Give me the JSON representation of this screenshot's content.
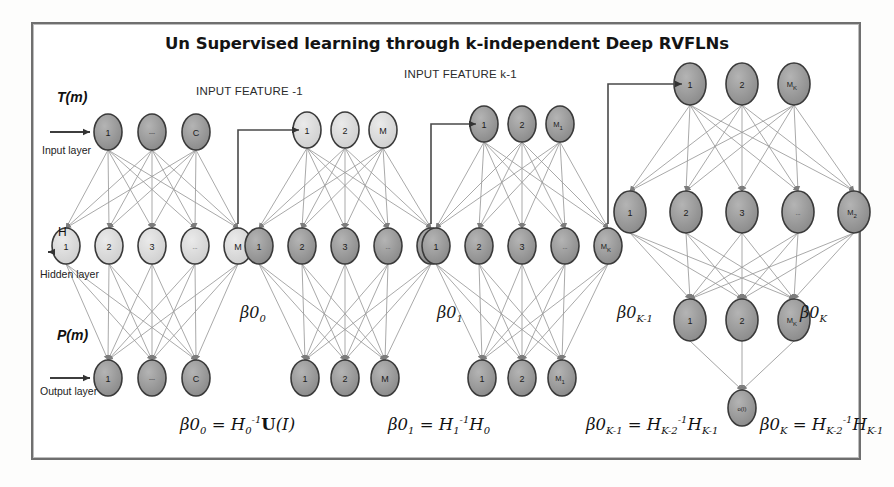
{
  "title": "Un Supervised learning through k-independent Deep RVFLNs",
  "annotations": {
    "input_feature_1": "INPUT FEATURE -1",
    "input_feature_k1": "INPUT FEATURE k-1",
    "signal_top": "T(m)",
    "signal_mid": "H",
    "signal_bottom": "P(m)",
    "layer_input": "Input layer",
    "layer_hidden": "Hidden layer",
    "layer_output": "Output layer"
  },
  "beta_labels": [
    {
      "base": "β0",
      "sub": "0"
    },
    {
      "base": "β0",
      "sub": "1"
    },
    {
      "base": "β0",
      "sub": "K-1"
    },
    {
      "base": "β0",
      "sub": "K"
    }
  ],
  "formulas": [
    {
      "lhs": "β0",
      "lhs_sub": "0",
      "rhs_html": "H<sub>0</sub><sup>-1</sup><b>U</b>(<i>I</i>)"
    },
    {
      "lhs": "β0",
      "lhs_sub": "1",
      "rhs_html": "H<sub>1</sub><sup>-1</sup>H<sub>0</sub>"
    },
    {
      "lhs": "β0",
      "lhs_sub": "K-1",
      "rhs_html": "H<sub>K-2</sub><sup>-1</sup>H<sub>K-1</sub>"
    },
    {
      "lhs": "β0",
      "lhs_sub": "K",
      "rhs_html": "H<sub>K-2</sub><sup>-1</sup>H<sub>K-1</sub>"
    }
  ],
  "colors": {
    "node_dark": "#8f8f8f",
    "node_light": "#d6d6d6",
    "node_stroke": "#3a3a3a",
    "edge": "#9a9a9a",
    "frame": "#6f6f6f",
    "text": "#1b1b1b"
  },
  "blocks": [
    {
      "name": "block-0",
      "cx": 152,
      "input": {
        "y": 132,
        "spacing": 44,
        "r": [
          14,
          18
        ],
        "shade": "dark",
        "labels": [
          "1",
          "---",
          "C"
        ]
      },
      "hidden": {
        "y": 246,
        "spacing": 43,
        "r": [
          14,
          18
        ],
        "shade": "light",
        "labels": [
          "1",
          "2",
          "3",
          "...",
          "M"
        ]
      },
      "output": {
        "y": 378,
        "spacing": 44,
        "r": [
          14,
          18
        ],
        "shade": "dark",
        "labels": [
          "1",
          "---",
          "C"
        ]
      }
    },
    {
      "name": "block-1",
      "cx": 345,
      "input": {
        "y": 130,
        "spacing": 38,
        "r": [
          14,
          18
        ],
        "shade": "light",
        "labels": [
          "1",
          "2",
          "M"
        ]
      },
      "hidden": {
        "y": 246,
        "spacing": 43,
        "r": [
          14,
          18
        ],
        "shade": "dark",
        "labels": [
          "1",
          "2",
          "3",
          "...",
          "M1"
        ]
      },
      "output": {
        "y": 378,
        "spacing": 40,
        "r": [
          14,
          18
        ],
        "shade": "dark",
        "labels": [
          "1",
          "2",
          "M"
        ]
      }
    },
    {
      "name": "block-2",
      "cx": 522,
      "input": {
        "y": 124,
        "spacing": 38,
        "r": [
          14,
          18
        ],
        "shade": "dark",
        "labels": [
          "1",
          "2",
          "M1"
        ]
      },
      "hidden": {
        "y": 246,
        "spacing": 43,
        "r": [
          14,
          18
        ],
        "shade": "dark",
        "labels": [
          "1",
          "2",
          "3",
          "...",
          "MK"
        ]
      },
      "output": {
        "y": 378,
        "spacing": 40,
        "r": [
          14,
          18
        ],
        "shade": "dark",
        "labels": [
          "1",
          "2",
          "M1"
        ]
      }
    },
    {
      "name": "block-3",
      "cx": 742,
      "input": {
        "y": 84,
        "spacing": 52,
        "r": [
          16,
          21
        ],
        "shade": "dark",
        "labels": [
          "1",
          "2",
          "MK"
        ]
      },
      "hidden": {
        "y": 212,
        "spacing": 56,
        "r": [
          16,
          21
        ],
        "shade": "dark",
        "labels": [
          "1",
          "2",
          "3",
          "...",
          "M2"
        ]
      },
      "output": {
        "y": 320,
        "spacing": 52,
        "r": [
          16,
          21
        ],
        "shade": "dark",
        "labels": [
          "1",
          "2",
          "MK"
        ]
      },
      "final": {
        "y": 408,
        "x": 742,
        "r": [
          14,
          18
        ],
        "shade": "dark",
        "label": "o(I)"
      }
    }
  ]
}
